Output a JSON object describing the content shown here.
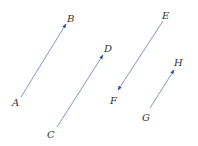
{
  "diagram": {
    "colors": {
      "line": "#6f8fb5",
      "arrowhead": "#2f4f9a",
      "label": "#333333"
    },
    "vectors": [
      {
        "name": "AB",
        "from": {
          "label": "A",
          "x": 21,
          "y": 97
        },
        "to": {
          "label": "B",
          "x": 66,
          "y": 24
        }
      },
      {
        "name": "CD",
        "from": {
          "label": "C",
          "x": 57,
          "y": 127
        },
        "to": {
          "label": "D",
          "x": 103,
          "y": 55
        }
      },
      {
        "name": "EF",
        "from": {
          "label": "E",
          "x": 163,
          "y": 21
        },
        "to": {
          "label": "F",
          "x": 118,
          "y": 90
        }
      },
      {
        "name": "GH",
        "from": {
          "label": "G",
          "x": 150,
          "y": 108
        },
        "to": {
          "label": "H",
          "x": 174,
          "y": 70
        }
      }
    ],
    "labels": {
      "A": "A",
      "B": "B",
      "C": "C",
      "D": "D",
      "E": "E",
      "F": "F",
      "G": "G",
      "H": "H"
    }
  }
}
